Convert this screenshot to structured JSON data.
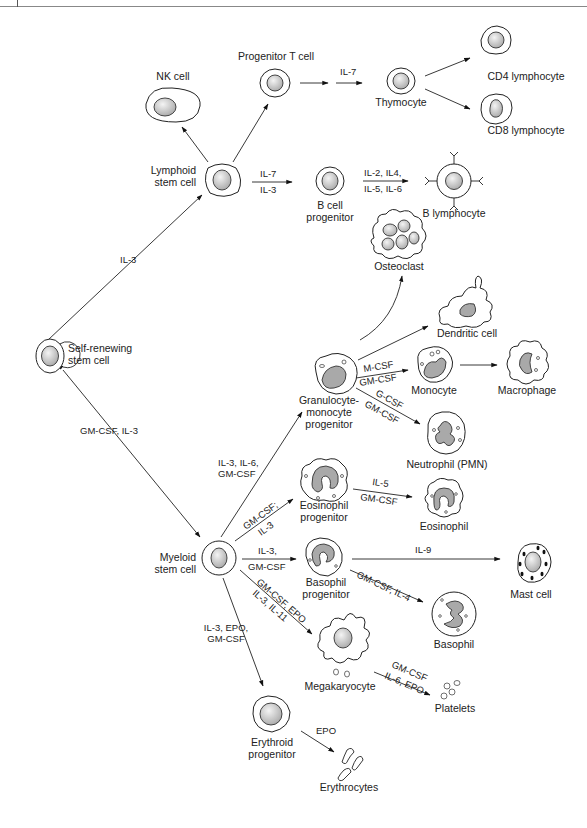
{
  "figure": {
    "cells": {
      "self_renewing": "Self-renewing\nstem cell",
      "lymphoid": "Lymphoid\nstem cell",
      "nk": "NK cell",
      "progenitor_t": "Progenitor T cell",
      "thymocyte": "Thymocyte",
      "cd4": "CD4 lymphocyte",
      "cd8": "CD8 lymphocyte",
      "b_progenitor": "B cell\nprogenitor",
      "b_lymphocyte": "B lymphocyte",
      "osteoclast": "Osteoclast",
      "dendritic": "Dendritic cell",
      "gm_progenitor": "Granulocyte-\nmonocyte\nprogenitor",
      "monocyte": "Monocyte",
      "macrophage": "Macrophage",
      "neutrophil": "Neutrophil (PMN)",
      "eos_progenitor": "Eosinophil\nprogenitor",
      "eosinophil": "Eosinophil",
      "myeloid": "Myeloid\nstem cell",
      "baso_progenitor": "Basophil\nprogenitor",
      "mast": "Mast cell",
      "basophil": "Basophil",
      "megakaryocyte": "Megakaryocyte",
      "platelets": "Platelets",
      "erythroid": "Erythroid\nprogenitor",
      "erythrocytes": "Erythrocytes"
    },
    "cytokines": {
      "to_lymphoid": "IL-3",
      "to_myeloid": "GM-CSF, IL-3",
      "progT_to_thymo": "IL-7",
      "lymph_to_b_top": "IL-7",
      "lymph_to_b_bottom": "IL-3",
      "b_to_blymph_top": "IL-2, IL4,",
      "b_to_blymph_bottom": "IL-5, IL-6",
      "to_gm_progenitor": "IL-3, IL-6,\nGM-CSF",
      "gm_to_mono_top": "M-CSF",
      "gm_to_mono_bottom": "GM-CSF",
      "gm_to_neut_top": "G-CSF",
      "gm_to_neut_bottom": "GM-CSF",
      "to_eos_prog_top": "GM-CSF;",
      "to_eos_prog_bottom": "IL-3",
      "eos_top": "IL-5",
      "eos_bottom": "GM-CSF",
      "to_baso_prog_top": "IL-3,",
      "to_baso_prog_bottom": "GM-CSF",
      "mast": "IL-9",
      "basophil": "GM-CSF, IL-4",
      "to_mega_top": "GM-CSF, EPO",
      "to_mega_bottom": "IL-3, IL-11",
      "to_erythroid": "IL-3, EPO,\nGM-CSF",
      "platelets_top": "GM-CSF",
      "platelets_bottom": "IL-6, EPO",
      "erythrocytes": "EPO"
    }
  }
}
